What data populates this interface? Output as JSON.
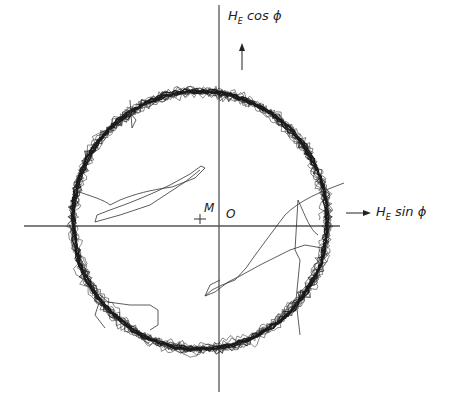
{
  "figure": {
    "y_axis_label": {
      "main": "H",
      "sub": "E",
      "rest": " cos ϕ"
    },
    "x_axis_label": {
      "main": "H",
      "sub": "E",
      "rest": " sin ϕ"
    },
    "origin_label": "O",
    "center_marker_label": "M",
    "colors": {
      "ink": "#222222",
      "axis": "#555555",
      "background": "#ffffff"
    }
  },
  "chart_data": {
    "type": "scatter",
    "title": "",
    "xlabel": "H_E sin ϕ",
    "ylabel": "H_E cos ϕ",
    "origin_px": [
      219,
      226
    ],
    "center_M_px": [
      200,
      220
    ],
    "ring_radius_px": 129,
    "annotations": [
      "O",
      "M",
      "H_E cos ϕ (arrow up)",
      "H_E sin ϕ (arrow right)"
    ],
    "grid": false
  }
}
